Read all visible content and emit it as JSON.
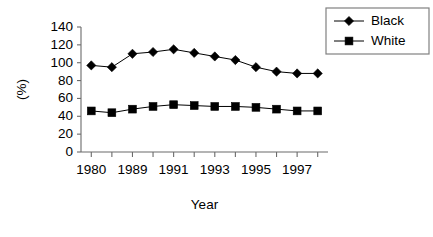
{
  "chart_data": {
    "type": "line",
    "title": "",
    "xlabel": "Year",
    "ylabel": "(%)",
    "ylim": [
      0,
      140
    ],
    "ytick_values": [
      0,
      20,
      40,
      60,
      80,
      100,
      120,
      140
    ],
    "ytick_labels": [
      "0",
      "20",
      "40",
      "60",
      "80",
      "100",
      "120",
      "140"
    ],
    "grid": false,
    "legend_position": "top-right",
    "x": [
      1980,
      1985,
      1989,
      1990,
      1991,
      1992,
      1993,
      1994,
      1995,
      1996,
      1997,
      1998
    ],
    "categories": [
      "1980",
      "",
      "1989",
      "",
      "1991",
      "",
      "1993",
      "",
      "1995",
      "",
      "1997",
      ""
    ],
    "xtick_labels_shown": [
      "1980",
      "1989",
      "1991",
      "1993",
      "1995",
      "1997"
    ],
    "series": [
      {
        "name": "Black",
        "marker": "diamond",
        "color": "#000000",
        "values": [
          97,
          95,
          110,
          112,
          115,
          111,
          107,
          103,
          95,
          90,
          88,
          88
        ]
      },
      {
        "name": "White",
        "marker": "square",
        "color": "#000000",
        "values": [
          46,
          44,
          48,
          51,
          53,
          52,
          51,
          51,
          50,
          48,
          46,
          46
        ]
      }
    ]
  },
  "legend": {
    "entries": [
      {
        "label": "Black",
        "marker": "diamond"
      },
      {
        "label": "White",
        "marker": "square"
      }
    ]
  },
  "axis": {
    "y_title": "(%)",
    "x_title": "Year"
  }
}
